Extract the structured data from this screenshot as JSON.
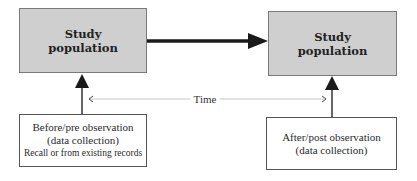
{
  "diagram": {
    "type": "before-after study design",
    "nodes": {
      "population_before": {
        "label_line1": "Study",
        "label_line2": "population"
      },
      "population_after": {
        "label_line1": "Study",
        "label_line2": "population"
      },
      "observation_before": {
        "line1": "Before/pre observation",
        "line2": "(data collection)",
        "line3": "Recall or from existing records"
      },
      "observation_after": {
        "line1": "After/post observation",
        "line2": "(data collection)"
      }
    },
    "time_axis": {
      "label": "Time"
    },
    "edges": [
      {
        "from": "population_before",
        "to": "population_after",
        "style": "thick-arrow"
      },
      {
        "from": "observation_before",
        "to": "population_before",
        "style": "arrow"
      },
      {
        "from": "observation_after",
        "to": "population_after",
        "style": "arrow"
      }
    ],
    "colors": {
      "population_fill": "#cfcfcf",
      "population_border": "#7a7a7a",
      "arrow": "#1a1a1a",
      "time_line": "#c8c8c8"
    }
  }
}
